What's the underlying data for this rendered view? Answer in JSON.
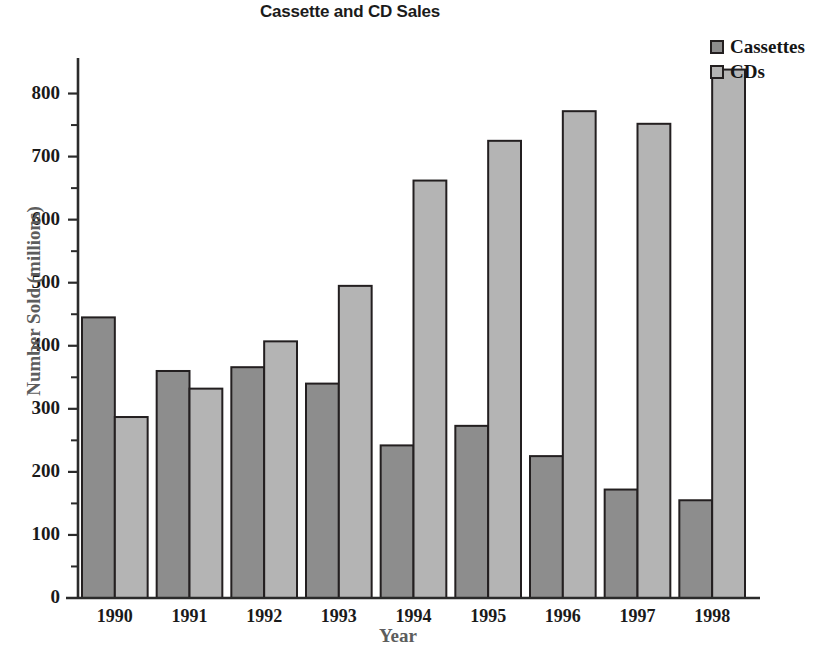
{
  "chart_data": {
    "type": "bar",
    "title": "Cassette and CD Sales",
    "xlabel": "Year",
    "ylabel": "Number Sold (millions)",
    "categories": [
      "1990",
      "1991",
      "1992",
      "1993",
      "1994",
      "1995",
      "1996",
      "1997",
      "1998"
    ],
    "series": [
      {
        "name": "Cassettes",
        "color": "#8d8d8d",
        "values": [
          445,
          360,
          366,
          340,
          242,
          273,
          225,
          172,
          155
        ]
      },
      {
        "name": "CDs",
        "color": "#b4b4b4",
        "values": [
          287,
          332,
          407,
          495,
          662,
          725,
          772,
          752,
          838
        ]
      }
    ],
    "ylim": [
      0,
      850
    ],
    "ytick_values": [
      0,
      100,
      200,
      300,
      400,
      500,
      600,
      700,
      800
    ],
    "ytick_labels": [
      "0",
      "100",
      "200",
      "300",
      "400",
      "500",
      "600",
      "700",
      "800"
    ],
    "yminor_values": [
      50,
      150,
      250,
      350,
      450,
      550,
      650,
      750
    ],
    "grid": false,
    "legend_position": "top-right"
  },
  "legend": {
    "entries": [
      {
        "label": "Cassettes",
        "swatch_color": "#8d8d8d"
      },
      {
        "label": "CDs",
        "swatch_color": "#b4b4b4"
      }
    ]
  },
  "source": {
    "text": "Source: World Almanac and Book of Facts 2000. Copyright © 1999 Primedia Reference Inc."
  },
  "colors": {
    "cassettes": "#8d8d8d",
    "cds": "#b4b4b4",
    "axis": "#2b2b2b",
    "bar_outline": "#231f20",
    "axis_title": "#5d5d5d",
    "background": "#ffffff"
  }
}
